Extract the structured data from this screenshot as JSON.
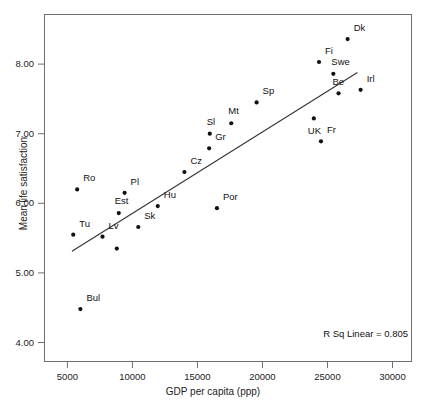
{
  "chart_data": {
    "type": "scatter",
    "title": "",
    "xlabel": "GDP per capita (ppp)",
    "ylabel": "Mean life satisfaction",
    "xlim": [
      3200,
      31500
    ],
    "ylim": [
      3.72,
      8.72
    ],
    "xticks": [
      5000,
      10000,
      15000,
      20000,
      25000,
      30000
    ],
    "xticklabels": [
      "5000",
      "10000",
      "15000",
      "20000",
      "25000",
      "30000"
    ],
    "yticks": [
      4.0,
      5.0,
      6.0,
      7.0,
      8.0
    ],
    "yticklabels": [
      "4.00",
      "5.00",
      "6.00",
      "7.00",
      "8.00"
    ],
    "grid": false,
    "legend": false,
    "annotations": [
      {
        "name": "r-squared",
        "text": "R Sq Linear = 0.805",
        "value": 0.805
      }
    ],
    "fit_line": {
      "type": "linear",
      "x_start": 5350,
      "y_start": 5.31,
      "x_end": 27300,
      "y_end": 7.88
    },
    "points": [
      {
        "label": "Ro",
        "x": 5750,
        "y": 6.2,
        "label_dx": 6,
        "label_dy": -12
      },
      {
        "label": "Tu",
        "x": 5450,
        "y": 5.55,
        "label_dx": 6,
        "label_dy": -12
      },
      {
        "label": "Bul",
        "x": 6000,
        "y": 4.48,
        "label_dx": 6,
        "label_dy": -12
      },
      {
        "label": "Lv",
        "x": 7700,
        "y": 5.52,
        "label_dx": 6,
        "label_dy": -12
      },
      {
        "label": "",
        "x": 8800,
        "y": 5.35,
        "label_dx": 0,
        "label_dy": 0
      },
      {
        "label": "Est",
        "x": 8950,
        "y": 5.86,
        "label_dx": -4,
        "label_dy": -13
      },
      {
        "label": "Pl",
        "x": 9400,
        "y": 6.15,
        "label_dx": 6,
        "label_dy": -12
      },
      {
        "label": "Sk",
        "x": 10450,
        "y": 5.66,
        "label_dx": 6,
        "label_dy": -12
      },
      {
        "label": "Hu",
        "x": 11950,
        "y": 5.96,
        "label_dx": 6,
        "label_dy": -12
      },
      {
        "label": "Cz",
        "x": 14000,
        "y": 6.45,
        "label_dx": 6,
        "label_dy": -12
      },
      {
        "label": "Gr",
        "x": 15900,
        "y": 6.79,
        "label_dx": 6,
        "label_dy": -12
      },
      {
        "label": "Sl",
        "x": 15950,
        "y": 7.0,
        "label_dx": -3,
        "label_dy": -13
      },
      {
        "label": "Por",
        "x": 16500,
        "y": 5.93,
        "label_dx": 6,
        "label_dy": -12
      },
      {
        "label": "Mt",
        "x": 17600,
        "y": 7.15,
        "label_dx": -3,
        "label_dy": -13
      },
      {
        "label": "Sp",
        "x": 19550,
        "y": 7.45,
        "label_dx": 6,
        "label_dy": -12
      },
      {
        "label": "UK",
        "x": 23950,
        "y": 7.22,
        "label_dx": -6,
        "label_dy": 12
      },
      {
        "label": "Fi",
        "x": 24350,
        "y": 8.03,
        "label_dx": 6,
        "label_dy": -12
      },
      {
        "label": "Fr",
        "x": 24500,
        "y": 6.89,
        "label_dx": 6,
        "label_dy": -12
      },
      {
        "label": "Swe",
        "x": 25450,
        "y": 7.86,
        "label_dx": -2,
        "label_dy": -13
      },
      {
        "label": "Be",
        "x": 25850,
        "y": 7.58,
        "label_dx": -6,
        "label_dy": -12
      },
      {
        "label": "Dk",
        "x": 26550,
        "y": 8.36,
        "label_dx": 6,
        "label_dy": -12
      },
      {
        "label": "Irl",
        "x": 27550,
        "y": 7.63,
        "label_dx": 6,
        "label_dy": -12
      }
    ]
  }
}
